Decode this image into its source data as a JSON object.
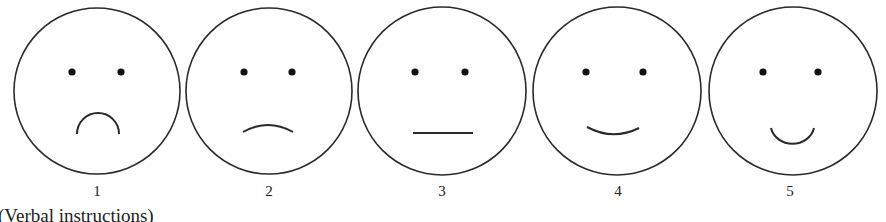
{
  "faces": [
    {
      "label": "1",
      "cx": 97,
      "expression": "very-sad"
    },
    {
      "label": "2",
      "cx": 269,
      "expression": "sad"
    },
    {
      "label": "3",
      "cx": 442,
      "expression": "neutral"
    },
    {
      "label": "4",
      "cx": 617,
      "expression": "happy"
    },
    {
      "label": "5",
      "cx": 793,
      "expression": "very-happy"
    }
  ],
  "caption": "(Verbal instructions)",
  "colors": {
    "stroke": "#2a2a2a",
    "background": "#ffffff"
  }
}
